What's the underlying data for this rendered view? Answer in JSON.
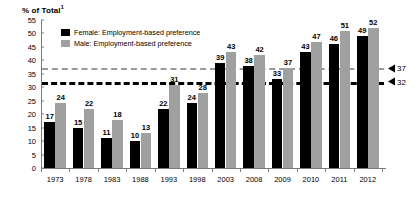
{
  "chart_data": {
    "type": "bar",
    "title": "% of Total",
    "title_superscript": "1",
    "xlabel": "",
    "ylabel": "% of Total",
    "ylim": [
      0,
      55
    ],
    "y_ticks": [
      0,
      5,
      10,
      15,
      20,
      25,
      30,
      35,
      40,
      45,
      50,
      55
    ],
    "grid": false,
    "legend_position": "top-left",
    "categories": [
      "1973",
      "1978",
      "1983",
      "1988",
      "1993",
      "1998",
      "2003",
      "2008",
      "2009",
      "2010",
      "2011",
      "2012"
    ],
    "series": [
      {
        "name": "Female: Employment-based preference",
        "color": "#000000",
        "values": [
          17,
          15,
          11,
          10,
          22,
          24,
          39,
          38,
          33,
          43,
          46,
          49
        ]
      },
      {
        "name": "Male: Employment-based preference",
        "color": "#a0a0a0",
        "values": [
          24,
          22,
          18,
          13,
          31,
          28,
          43,
          42,
          37,
          47,
          51,
          52
        ]
      }
    ],
    "reference_lines": [
      {
        "name": "male-average",
        "value": 37,
        "label": "37",
        "color": "#9a9a9a",
        "style": "dashed"
      },
      {
        "name": "female-average",
        "value": 32,
        "label": "32",
        "color": "#000000",
        "style": "dashed"
      }
    ]
  }
}
